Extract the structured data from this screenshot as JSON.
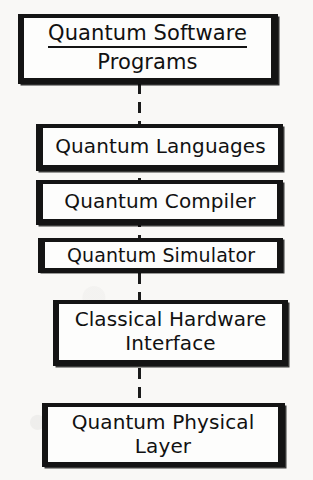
{
  "diagram": {
    "orientation": "vertical",
    "background_color": "#f9f8f6",
    "ink_color": "#141414",
    "connector": {
      "style": "dashed",
      "color": "#1b1b1b",
      "orientation": "vertical"
    },
    "nodes": [
      {
        "id": "quantum-software-programs",
        "lines": [
          "Quantum Software",
          "Programs"
        ],
        "underline_first_line": true
      },
      {
        "id": "quantum-languages",
        "lines": [
          "Quantum Languages"
        ],
        "underline_first_line": false
      },
      {
        "id": "quantum-compiler",
        "lines": [
          "Quantum Compiler"
        ],
        "underline_first_line": false
      },
      {
        "id": "quantum-simulator",
        "lines": [
          "Quantum Simulator"
        ],
        "underline_first_line": false
      },
      {
        "id": "classical-hardware-interface",
        "lines": [
          "Classical Hardware",
          "Interface"
        ],
        "underline_first_line": false
      },
      {
        "id": "quantum-physical-layer",
        "lines": [
          "Quantum Physical",
          "Layer"
        ],
        "underline_first_line": false
      }
    ]
  }
}
